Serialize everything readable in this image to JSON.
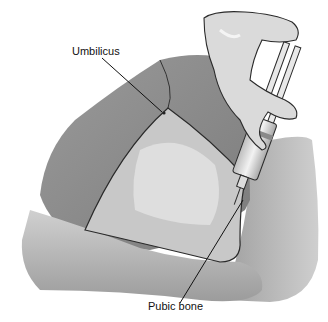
{
  "figure": {
    "labels": {
      "umbilicus": "Umbilicus",
      "pubic_bone": "Pubic bone"
    }
  },
  "colors": {
    "background": "#ffffff",
    "skin_dark": "#8a8a8a",
    "skin_mid": "#a8a8a8",
    "skin_light": "#d4d4d4",
    "highlight": "#e8e8e8",
    "outline": "#2a2a2a"
  }
}
